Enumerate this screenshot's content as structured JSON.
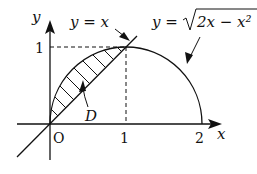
{
  "diagram": {
    "axes": {
      "x_label": "x",
      "y_label": "y",
      "origin_label": "O",
      "x_ticks": [
        "1",
        "2"
      ],
      "y_ticks": [
        "1"
      ]
    },
    "curves": {
      "line_label": "y = x",
      "semicircle_label_prefix": "y = ",
      "semicircle_radicand": "2x − x²"
    },
    "region_label": "D",
    "colors": {
      "stroke": "#111111",
      "background": "#ffffff"
    }
  }
}
